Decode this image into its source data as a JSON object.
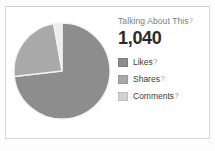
{
  "card": {
    "title": "Talking About This",
    "title_help": "?",
    "value": "1,040"
  },
  "legend": [
    {
      "label": "Likes",
      "help": "?",
      "color": "#8d8d8d",
      "swatch_name": "legend-swatch-likes"
    },
    {
      "label": "Shares",
      "help": "?",
      "color": "#a9a9a9",
      "swatch_name": "legend-swatch-shares"
    },
    {
      "label": "Comments",
      "help": "?",
      "color": "#d2d2d2",
      "swatch_name": "legend-swatch-comments"
    }
  ],
  "colors": {
    "likes": "#8d8d8d",
    "shares": "#a9a9a9",
    "comments": "#ededed",
    "slice_border": "#f2f2f2",
    "card_border": "#d9d9d9",
    "title_text": "#7d7d7d",
    "value_text": "#2b2b2b",
    "label_text": "#3d3d3d",
    "background": "#ffffff"
  },
  "chart_data": {
    "type": "pie",
    "title": "Talking About This",
    "total": 1040,
    "categories": [
      "Likes",
      "Shares",
      "Comments"
    ],
    "values": [
      761,
      250,
      29
    ],
    "percentages": [
      73.2,
      24.0,
      2.8
    ],
    "colors": [
      "#8d8d8d",
      "#a9a9a9",
      "#ededed"
    ],
    "legend_position": "right",
    "grid": false,
    "start_angle_deg": -90,
    "direction": "clockwise",
    "slice_stroke": "#f2f2f2",
    "labels_shown": false
  }
}
